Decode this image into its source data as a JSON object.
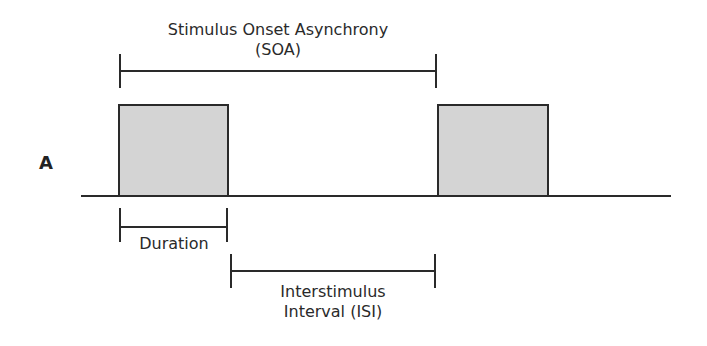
{
  "diagram": {
    "panel_label": "A",
    "soa": {
      "line1": "Stimulus Onset Asynchrony",
      "line2": "(SOA)"
    },
    "duration": {
      "label": "Duration"
    },
    "isi": {
      "line1": "Interstimulus",
      "line2": "Interval (ISI)"
    },
    "stimuli": [
      {
        "name": "stimulus-1",
        "fill": "#d4d4d4"
      },
      {
        "name": "stimulus-2",
        "fill": "#d4d4d4"
      }
    ]
  }
}
